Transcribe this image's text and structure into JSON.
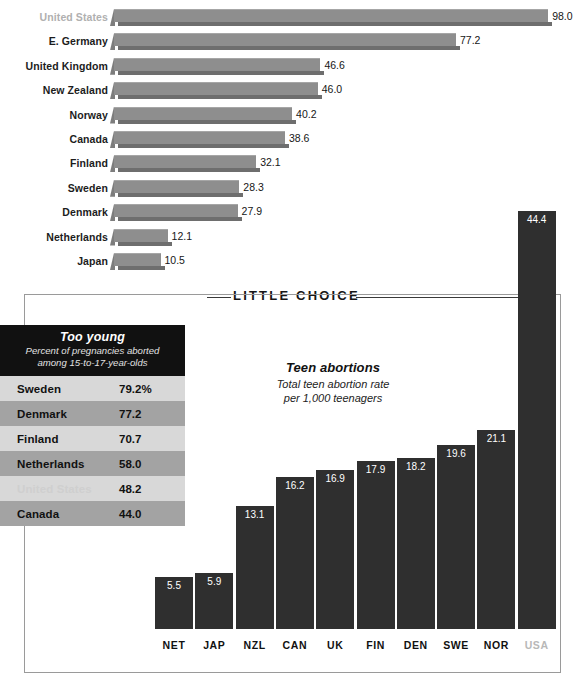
{
  "chart_data": [
    {
      "type": "bar",
      "orientation": "horizontal",
      "title": "",
      "xlabel": "",
      "ylabel": "",
      "value_suffix": "",
      "xlim": [
        0,
        98
      ],
      "grid": false,
      "categories": [
        "United States",
        "E. Germany",
        "United Kingdom",
        "New Zealand",
        "Norway",
        "Canada",
        "Finland",
        "Sweden",
        "Denmark",
        "Netherlands",
        "Japan"
      ],
      "values": [
        98.0,
        77.2,
        46.6,
        46.0,
        40.2,
        38.6,
        32.1,
        28.3,
        27.9,
        12.1,
        10.5
      ],
      "labels": [
        "98.0",
        "77.2",
        "46.6",
        "46.0",
        "40.2",
        "38.6",
        "32.1",
        "28.3",
        "27.9",
        "12.1",
        "10.5"
      ],
      "highlighted": [
        "United States"
      ]
    },
    {
      "type": "bar",
      "orientation": "vertical",
      "title": "Teen abortions",
      "subtitle_line1": "Total teen abortion rate",
      "subtitle_line2": "per 1,000 teenagers",
      "xlabel": "",
      "ylabel": "",
      "ylim": [
        0,
        44.4
      ],
      "grid": false,
      "categories": [
        "NET",
        "JAP",
        "NZL",
        "CAN",
        "UK",
        "FIN",
        "DEN",
        "SWE",
        "NOR",
        "USA"
      ],
      "values": [
        5.5,
        5.9,
        13.1,
        16.2,
        16.9,
        17.9,
        18.2,
        19.6,
        21.1,
        44.4
      ],
      "labels": [
        "5.5",
        "5.9",
        "13.1",
        "16.2",
        "16.9",
        "17.9",
        "18.2",
        "19.6",
        "21.1",
        "44.4"
      ],
      "highlighted": [
        "USA"
      ]
    },
    {
      "type": "table",
      "title": "Too young",
      "subtitle_line1": "Percent of pregnancies aborted",
      "subtitle_line2": "among 15-to-17-year-olds",
      "categories": [
        "Sweden",
        "Denmark",
        "Finland",
        "Netherlands",
        "United States",
        "Canada"
      ],
      "values": [
        79.2,
        77.2,
        70.7,
        58.0,
        48.2,
        44.0
      ],
      "labels": [
        "79.2%",
        "77.2",
        "70.7",
        "58.0",
        "48.2",
        "44.0"
      ],
      "highlighted": [
        "United States"
      ]
    }
  ],
  "section": {
    "header": "LITTLE CHOICE"
  },
  "colors": {
    "hbar_fill": "#8e8e8e",
    "hbar_shadow": "#6e6e6e",
    "vbar_fill": "#2f2f2f",
    "table_header_bg": "#111111",
    "table_row_light": "#d8d8d8",
    "table_row_dark": "#a3a3a3",
    "muted_text": "#b8b8b8",
    "body_text": "#111111",
    "panel_border": "#9a9a9a"
  }
}
